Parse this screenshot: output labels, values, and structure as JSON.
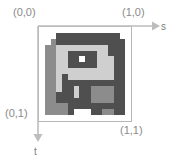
{
  "figure": {
    "kind": "texture-coordinate-diagram",
    "corner_labels": {
      "top_left": "(0,0)",
      "top_right": "(1,0)",
      "bottom_left": "(0,1)",
      "bottom_right": "(1,1)"
    },
    "axes": {
      "horizontal": {
        "name": "s",
        "label": "s",
        "direction": "right",
        "from": "(0,0)",
        "to": "(1,0)"
      },
      "vertical": {
        "name": "t",
        "label": "t",
        "direction": "down",
        "from": "(0,0)",
        "to": "(0,1)"
      }
    },
    "frame": {
      "border_color": "#b6b6b6",
      "background_color": "#ffffff"
    },
    "colors": {
      "label_text": "#8a8a8a",
      "axis_line": "#bdbdbd",
      "texture_dark": "#4f4f4f",
      "texture_mid": "#8c8c8c",
      "texture_light": "#b9b9b9",
      "texture_lighter": "#cfcfcf",
      "texture_white": "#ffffff"
    },
    "texture": {
      "description": "blocky pixelated grayscale texture sample",
      "grid_cols": 16,
      "grid_rows": 16,
      "palette": [
        "#ffffff",
        "#cfcfcf",
        "#b9b9b9",
        "#8c8c8c",
        "#4f4f4f"
      ],
      "cells": [
        [
          0,
          0,
          0,
          0,
          0,
          0,
          0,
          0,
          0,
          0,
          0,
          0,
          0,
          0,
          0,
          0
        ],
        [
          0,
          0,
          0,
          4,
          4,
          4,
          4,
          4,
          4,
          4,
          4,
          4,
          4,
          4,
          0,
          0
        ],
        [
          0,
          0,
          3,
          4,
          4,
          4,
          4,
          4,
          4,
          4,
          4,
          4,
          4,
          4,
          4,
          0
        ],
        [
          0,
          3,
          3,
          1,
          1,
          1,
          1,
          1,
          1,
          1,
          1,
          1,
          4,
          4,
          4,
          0
        ],
        [
          0,
          3,
          3,
          1,
          1,
          4,
          4,
          4,
          4,
          4,
          1,
          1,
          4,
          4,
          4,
          0
        ],
        [
          0,
          3,
          3,
          1,
          1,
          4,
          4,
          0,
          4,
          4,
          1,
          1,
          1,
          4,
          4,
          0
        ],
        [
          0,
          3,
          3,
          1,
          1,
          4,
          4,
          4,
          4,
          4,
          1,
          1,
          1,
          4,
          4,
          0
        ],
        [
          0,
          3,
          3,
          1,
          1,
          1,
          1,
          1,
          1,
          1,
          1,
          1,
          1,
          4,
          4,
          0
        ],
        [
          0,
          3,
          3,
          1,
          4,
          1,
          1,
          1,
          1,
          1,
          1,
          1,
          1,
          4,
          4,
          0
        ],
        [
          0,
          3,
          3,
          1,
          4,
          4,
          4,
          4,
          4,
          4,
          4,
          4,
          4,
          4,
          4,
          0
        ],
        [
          0,
          3,
          3,
          1,
          4,
          4,
          1,
          4,
          4,
          3,
          3,
          3,
          3,
          4,
          4,
          0
        ],
        [
          0,
          3,
          3,
          4,
          4,
          4,
          1,
          4,
          4,
          3,
          3,
          3,
          3,
          4,
          4,
          0
        ],
        [
          0,
          3,
          3,
          4,
          4,
          4,
          4,
          4,
          4,
          3,
          3,
          3,
          3,
          4,
          4,
          0
        ],
        [
          0,
          3,
          3,
          3,
          3,
          4,
          4,
          4,
          4,
          4,
          4,
          4,
          4,
          4,
          4,
          0
        ],
        [
          0,
          3,
          3,
          3,
          3,
          4,
          0,
          0,
          0,
          4,
          4,
          3,
          3,
          4,
          4,
          0
        ],
        [
          0,
          0,
          0,
          0,
          0,
          0,
          0,
          0,
          0,
          0,
          0,
          0,
          0,
          0,
          0,
          0
        ]
      ]
    }
  }
}
